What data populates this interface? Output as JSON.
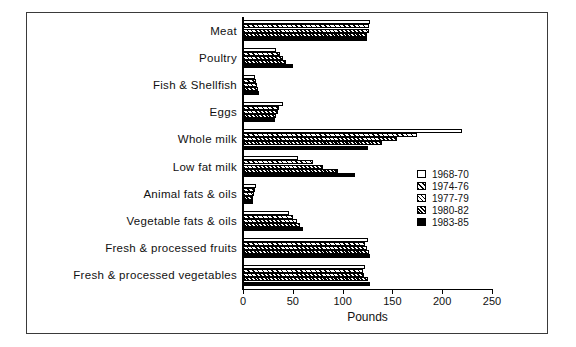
{
  "chart_data": {
    "type": "bar",
    "orientation": "horizontal",
    "title": "",
    "xlabel": "Pounds",
    "ylabel": "",
    "xlim": [
      0,
      250
    ],
    "xticks": [
      0,
      50,
      100,
      150,
      200,
      250
    ],
    "xticklabels": [
      "0",
      "50",
      "100",
      "150",
      "200",
      "250"
    ],
    "grid": false,
    "legend_position": "right-inside",
    "categories": [
      "Meat",
      "Poultry",
      "Fish & Shellfish",
      "Eggs",
      "Whole milk",
      "Low fat milk",
      "Animal fats & oils",
      "Vegetable fats & oils",
      "Fresh & processed fruits",
      "Fresh & processed vegetables"
    ],
    "series": [
      {
        "name": "1968-70",
        "pattern": "open-white",
        "values": [
          128,
          33,
          12,
          40,
          220,
          55,
          13,
          46,
          125,
          122
        ]
      },
      {
        "name": "1974-76",
        "pattern": "sparse-hatch",
        "values": [
          127,
          37,
          13,
          36,
          175,
          70,
          12,
          50,
          122,
          120
        ]
      },
      {
        "name": "1977-79",
        "pattern": "medium-hatch",
        "values": [
          127,
          40,
          14,
          35,
          155,
          80,
          11,
          54,
          124,
          121
        ]
      },
      {
        "name": "1980-82",
        "pattern": "dense-hatch",
        "values": [
          124,
          43,
          15,
          33,
          140,
          95,
          10,
          57,
          127,
          125
        ]
      },
      {
        "name": "1983-85",
        "pattern": "solid-black",
        "values": [
          124,
          50,
          16,
          32,
          125,
          112,
          10,
          60,
          128,
          128
        ]
      }
    ]
  },
  "legend": {
    "entries": [
      {
        "label": "1968-70"
      },
      {
        "label": "1974-76"
      },
      {
        "label": "1977-79"
      },
      {
        "label": "1980-82"
      },
      {
        "label": "1983-85"
      }
    ]
  }
}
